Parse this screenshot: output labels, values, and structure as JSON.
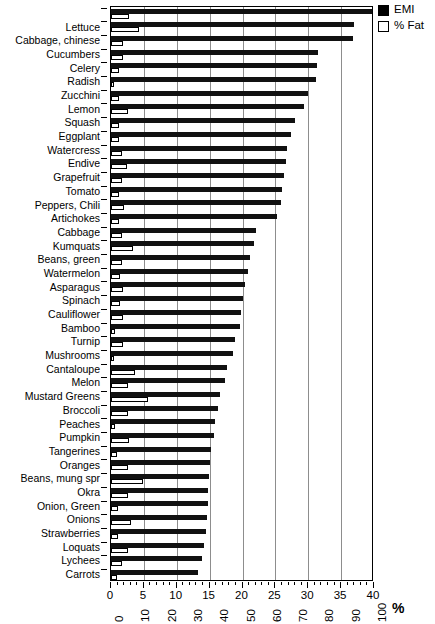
{
  "title": "Water Content per Unit Weight (partially clipped)",
  "legend": {
    "position": "top-right",
    "entries": [
      {
        "key": "filled-square",
        "label": "EMI",
        "color": "#111111"
      },
      {
        "key": "open-square",
        "label": "% Fat",
        "color": "#ffffff"
      }
    ]
  },
  "axes": {
    "top_scale_label": "EMI",
    "bottom_scale_label": "% Fat",
    "percent_symbol": "%",
    "top_ticks": [
      "0",
      "5",
      "10",
      "15",
      "20",
      "25",
      "30",
      "35",
      "40"
    ],
    "bottom_ticks": [
      "0",
      "10",
      "20",
      "30",
      "40",
      "50",
      "60",
      "70",
      "80",
      "90",
      "100"
    ]
  },
  "chart_data": {
    "type": "bar",
    "orientation": "horizontal",
    "title": "Water Content per Unit Weight (partially clipped)",
    "xlabel": "%",
    "ylabel": "",
    "grid": true,
    "legend_position": "top-right",
    "xlim_emi": [
      0,
      40
    ],
    "xlim_fat": [
      0,
      100
    ],
    "categories": [
      "",
      "Lettuce",
      "Cabbage, chinese",
      "Cucumbers",
      "Celery",
      "Radish",
      "Zucchini",
      "Lemon",
      "Squash",
      "Eggplant",
      "Watercress",
      "Endive",
      "Grapefruit",
      "Tomato",
      "Peppers, Chili",
      "Artichokes",
      "Cabbage",
      "Kumquats",
      "Beans, green",
      "Watermelon",
      "Asparagus",
      "Spinach",
      "Cauliflower",
      "Bamboo",
      "Turnip",
      "Mushrooms",
      "Cantaloupe",
      "Melon",
      "Mustard Greens",
      "Broccoli",
      "Peaches",
      "Pumpkin",
      "Tangerines",
      "Oranges",
      "Beans, mung spr",
      "Okra",
      "Onion, Green",
      "Onions",
      "Strawberries",
      "Loquats",
      "Lychees",
      "Carrots"
    ],
    "series": [
      {
        "name": "EMI",
        "color": "#111111",
        "scale": "top",
        "values": [
          40.0,
          37.0,
          36.8,
          31.5,
          31.3,
          31.2,
          30.0,
          29.4,
          28.0,
          27.4,
          26.8,
          26.6,
          26.3,
          26.0,
          25.8,
          25.2,
          22.0,
          21.8,
          21.2,
          20.9,
          20.4,
          20.0,
          19.8,
          19.6,
          18.8,
          18.5,
          17.6,
          17.4,
          16.6,
          16.2,
          15.8,
          15.6,
          15.2,
          15.0,
          14.9,
          14.8,
          14.7,
          14.6,
          14.4,
          14.2,
          13.8,
          13.2
        ]
      },
      {
        "name": "% Fat",
        "color": "#ffffff",
        "scale": "bottom",
        "values": [
          7.0,
          10.5,
          4.5,
          4.5,
          3.2,
          1.2,
          3.2,
          6.5,
          3.0,
          3.0,
          4.2,
          6.0,
          4.0,
          3.2,
          5.0,
          3.0,
          4.0,
          8.5,
          4.2,
          3.5,
          4.4,
          3.5,
          4.5,
          1.5,
          4.5,
          1.2,
          9.0,
          6.5,
          14.0,
          6.5,
          1.5,
          7.0,
          2.2,
          6.5,
          12.0,
          6.5,
          2.5,
          7.5,
          2.5,
          6.5,
          4.0,
          2.2
        ]
      }
    ]
  }
}
